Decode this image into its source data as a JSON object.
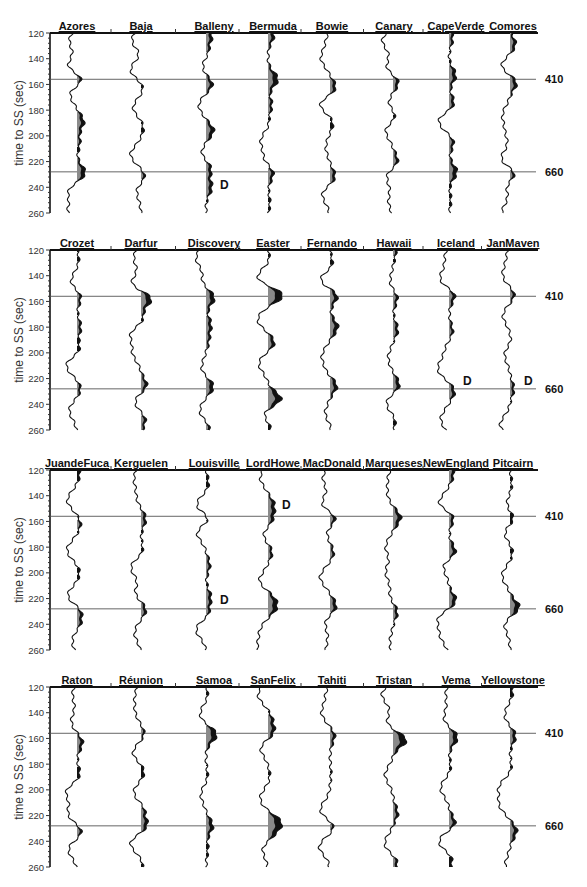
{
  "chart_data": {
    "type": "line",
    "title": "",
    "ylabel": "time to SS (sec)",
    "ylim": [
      120,
      260
    ],
    "yticks": [
      120,
      140,
      160,
      180,
      200,
      220,
      240,
      260
    ],
    "y_inverted": true,
    "reference_lines": [
      {
        "label": "410",
        "time": 156
      },
      {
        "label": "660",
        "time": 228
      }
    ],
    "fill_legend": {
      "gray": "positive lobe (model)",
      "black": "positive lobe (data)"
    },
    "panels": [
      {
        "stations": [
          "Azores",
          "Baja",
          "Balleny",
          "Bermuda",
          "Bowie",
          "Canary",
          "CapeVerde",
          "Comores"
        ],
        "d_markers": [
          {
            "station": "Balleny",
            "time": 238
          }
        ]
      },
      {
        "stations": [
          "Crozet",
          "Darfur",
          "Discovery",
          "Easter",
          "Fernando",
          "Hawaii",
          "Iceland",
          "JanMaven"
        ],
        "d_markers": [
          {
            "station": "Iceland",
            "time": 222
          },
          {
            "station": "JanMaven",
            "time": 222
          }
        ]
      },
      {
        "stations": [
          "JuandeFuca",
          "Kerguelen",
          "Louisville",
          "LordHowe",
          "MacDonald",
          "Marqueses",
          "NewEngland",
          "Pitcairn"
        ],
        "d_markers": [
          {
            "station": "Louisville",
            "time": 221
          },
          {
            "station": "LordHowe",
            "time": 147
          }
        ]
      },
      {
        "stations": [
          "Raton",
          "Réunion",
          "Samoa",
          "SanFelix",
          "Tahiti",
          "Tristan",
          "Vema",
          "Yellowstone"
        ],
        "d_markers": []
      }
    ],
    "peaks": {
      "Azores": [
        [
          156,
          9
        ],
        [
          189,
          7
        ],
        [
          205,
          3
        ],
        [
          229,
          9
        ]
      ],
      "Baja": [
        [
          136,
          2
        ],
        [
          163,
          3
        ],
        [
          193,
          3
        ],
        [
          232,
          5
        ]
      ],
      "Balleny": [
        [
          122,
          6
        ],
        [
          135,
          3
        ],
        [
          160,
          7
        ],
        [
          196,
          8
        ],
        [
          225,
          6
        ],
        [
          240,
          6
        ]
      ],
      "Bermuda": [
        [
          122,
          6
        ],
        [
          156,
          10
        ],
        [
          176,
          4
        ],
        [
          193,
          2
        ],
        [
          229,
          6
        ],
        [
          252,
          2
        ]
      ],
      "Bowie": [
        [
          163,
          7
        ],
        [
          189,
          4
        ],
        [
          232,
          6
        ]
      ],
      "Canary": [
        [
          158,
          7
        ],
        [
          185,
          5
        ],
        [
          220,
          6
        ]
      ],
      "CapeVerde": [
        [
          124,
          4
        ],
        [
          153,
          7
        ],
        [
          175,
          6
        ],
        [
          205,
          5
        ],
        [
          228,
          8
        ],
        [
          250,
          2
        ]
      ],
      "Comores": [
        [
          129,
          6
        ],
        [
          158,
          8
        ],
        [
          229,
          8
        ]
      ],
      "Crozet": [
        [
          128,
          2
        ],
        [
          156,
          5
        ],
        [
          180,
          4
        ],
        [
          198,
          4
        ],
        [
          228,
          4
        ]
      ],
      "Darfur": [
        [
          157,
          13
        ],
        [
          175,
          4
        ],
        [
          226,
          7
        ],
        [
          252,
          5
        ]
      ],
      "Discovery": [
        [
          157,
          9
        ],
        [
          178,
          5
        ],
        [
          190,
          3
        ],
        [
          226,
          8
        ],
        [
          258,
          4
        ]
      ],
      "Easter": [
        [
          128,
          2
        ],
        [
          155,
          16
        ],
        [
          192,
          7
        ],
        [
          236,
          14
        ],
        [
          258,
          4
        ]
      ],
      "Fernando": [
        [
          132,
          4
        ],
        [
          155,
          9
        ],
        [
          180,
          8
        ],
        [
          225,
          8
        ],
        [
          258,
          2
        ]
      ],
      "Hawaii": [
        [
          122,
          3
        ],
        [
          157,
          5
        ],
        [
          182,
          5
        ],
        [
          225,
          7
        ],
        [
          252,
          3
        ]
      ],
      "Iceland": [
        [
          155,
          7
        ],
        [
          183,
          4
        ],
        [
          230,
          6
        ]
      ],
      "JanMaven": [
        [
          155,
          5
        ],
        [
          192,
          2
        ],
        [
          228,
          4
        ]
      ],
      "JuandeFuca": [
        [
          123,
          3
        ],
        [
          162,
          4
        ],
        [
          200,
          3
        ],
        [
          228,
          5
        ],
        [
          238,
          4
        ]
      ],
      "Kerguelen": [
        [
          158,
          5
        ],
        [
          184,
          3
        ],
        [
          228,
          6
        ]
      ],
      "Louisville": [
        [
          131,
          3
        ],
        [
          158,
          7
        ],
        [
          194,
          4
        ],
        [
          219,
          5
        ],
        [
          232,
          4
        ]
      ],
      "LordHowe": [
        [
          147,
          6
        ],
        [
          158,
          5
        ],
        [
          183,
          5
        ],
        [
          218,
          5
        ],
        [
          227,
          8
        ]
      ],
      "MacDonald": [
        [
          157,
          8
        ],
        [
          184,
          4
        ],
        [
          226,
          7
        ]
      ],
      "Marqueses": [
        [
          157,
          8
        ],
        [
          230,
          5
        ]
      ],
      "NewEngland": [
        [
          123,
          5
        ],
        [
          156,
          7
        ],
        [
          184,
          8
        ],
        [
          222,
          8
        ]
      ],
      "Pitcairn": [
        [
          131,
          2
        ],
        [
          158,
          6
        ],
        [
          184,
          3
        ],
        [
          227,
          10
        ]
      ],
      "Raton": [
        [
          163,
          6
        ],
        [
          189,
          4
        ],
        [
          233,
          6
        ]
      ],
      "Réunion": [
        [
          157,
          4
        ],
        [
          186,
          4
        ],
        [
          215,
          4
        ],
        [
          228,
          7
        ],
        [
          258,
          2
        ]
      ],
      "Samoa": [
        [
          127,
          2
        ],
        [
          157,
          11
        ],
        [
          190,
          2
        ],
        [
          228,
          7
        ],
        [
          246,
          2
        ]
      ],
      "SanFelix": [
        [
          145,
          4
        ],
        [
          156,
          7
        ],
        [
          189,
          2
        ],
        [
          225,
          12
        ],
        [
          234,
          6
        ]
      ],
      "Tahiti": [
        [
          158,
          5
        ],
        [
          187,
          1
        ],
        [
          229,
          5
        ]
      ],
      "Tristan": [
        [
          161,
          14
        ],
        [
          218,
          5
        ],
        [
          257,
          5
        ]
      ],
      "Vema": [
        [
          159,
          9
        ],
        [
          183,
          2
        ],
        [
          226,
          7
        ],
        [
          254,
          4
        ]
      ],
      "Yellowstone": [
        [
          124,
          3
        ],
        [
          158,
          6
        ],
        [
          184,
          2
        ],
        [
          232,
          7
        ]
      ]
    }
  }
}
